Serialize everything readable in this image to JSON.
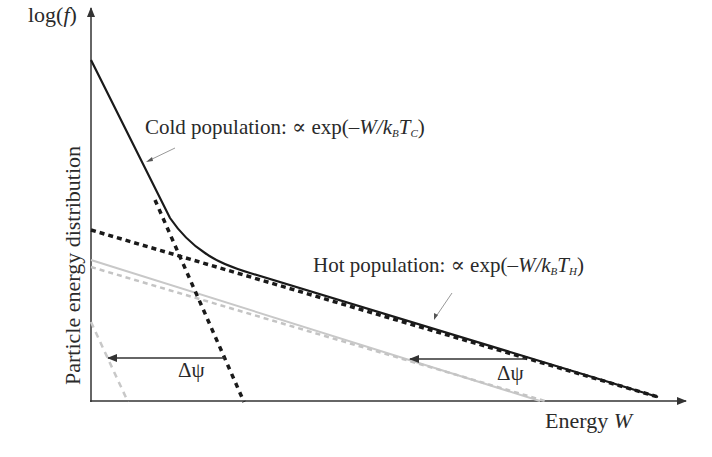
{
  "diagram": {
    "y_axis_label_top": "log(f)",
    "y_axis_label_top_parts": {
      "prefix": "log(",
      "var": "f",
      "suffix": ")"
    },
    "y_axis_label": "Particle energy distribution",
    "x_axis_label": "Energy",
    "x_axis_var": "W",
    "cold_label": {
      "prefix": "Cold population: ∝ exp(–",
      "var": "W",
      "slash": "/",
      "k": "k",
      "k_sub": "B",
      "t": "T",
      "t_sub": "C",
      "suffix": ")"
    },
    "hot_label": {
      "prefix": "Hot population: ∝ exp(–",
      "var": "W",
      "slash": "/",
      "k": "k",
      "k_sub": "B",
      "t": "T",
      "t_sub": "H",
      "suffix": ")"
    },
    "delta_psi_left": "Δψ",
    "delta_psi_right": "Δψ",
    "colors": {
      "black": "#1a1a1a",
      "gray": "#c4c4c4",
      "axis": "#333333"
    }
  }
}
